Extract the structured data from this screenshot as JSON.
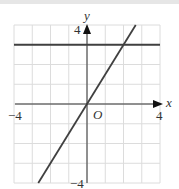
{
  "chart_data": {
    "type": "line",
    "title": "",
    "xlabel": "x",
    "ylabel": "y",
    "origin_label": "O",
    "xlim": [
      -4,
      4
    ],
    "ylim": [
      -4,
      4
    ],
    "grid": true,
    "grid_step": 1,
    "x_tick_labels": [
      "-4",
      "4"
    ],
    "y_tick_labels": [
      "4",
      "-4"
    ],
    "series": [
      {
        "name": "y = 3",
        "equation": "y = 3",
        "points": [
          [
            -4,
            3
          ],
          [
            4,
            3
          ]
        ]
      },
      {
        "name": "y = 1.5x",
        "equation": "y = 1.5x",
        "points": [
          [
            -2.67,
            -4
          ],
          [
            2.67,
            4
          ]
        ]
      }
    ],
    "intersection": [
      2,
      3
    ],
    "colors": {
      "lines": "#404040",
      "grid": "#dcdcdc",
      "axes": "#333333"
    }
  },
  "labels": {
    "x_axis": "x",
    "y_axis": "y",
    "origin": "O",
    "x_min": "−4",
    "x_max": "4",
    "y_max": "4",
    "y_min": "−4"
  }
}
